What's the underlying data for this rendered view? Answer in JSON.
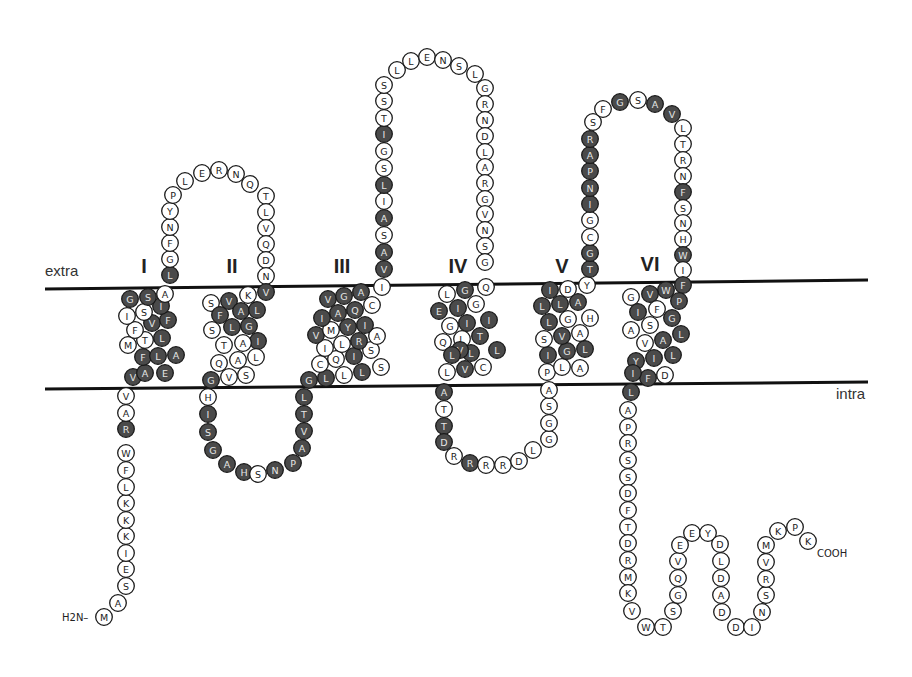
{
  "diagram": {
    "type": "membrane-topology",
    "regions": {
      "extra": "extra",
      "intra": "intra"
    },
    "termini": {
      "n": "H2N–",
      "c": "COOH"
    },
    "colors": {
      "dark": "#4a4a4a",
      "light": "#ffffff",
      "membrane": "#111111"
    },
    "membrane": {
      "top": {
        "x1": 45,
        "y1": 289,
        "x2": 868,
        "y2": 280
      },
      "bottom": {
        "x1": 45,
        "y1": 389,
        "x2": 868,
        "y2": 382
      }
    },
    "region_labels": [
      {
        "text": "extra",
        "x": 45,
        "y": 276
      },
      {
        "text": "intra",
        "x": 836,
        "y": 399
      }
    ],
    "tm_labels": [
      {
        "text": "I",
        "x": 144,
        "y": 273
      },
      {
        "text": "II",
        "x": 232,
        "y": 273
      },
      {
        "text": "III",
        "x": 342,
        "y": 273
      },
      {
        "text": "IV",
        "x": 458,
        "y": 273
      },
      {
        "text": "V",
        "x": 562,
        "y": 273
      },
      {
        "text": "VI",
        "x": 650,
        "y": 271
      }
    ],
    "residues": [
      [
        "M",
        104,
        617,
        0
      ],
      [
        "A",
        118,
        603,
        0
      ],
      [
        "S",
        126,
        586,
        0
      ],
      [
        "E",
        126,
        569,
        0
      ],
      [
        "I",
        126,
        553,
        0
      ],
      [
        "K",
        126,
        536,
        0
      ],
      [
        "K",
        126,
        520,
        0
      ],
      [
        "K",
        126,
        503,
        0
      ],
      [
        "L",
        126,
        487,
        0
      ],
      [
        "F",
        126,
        470,
        0
      ],
      [
        "W",
        126,
        453,
        0
      ],
      [
        "R",
        126,
        429,
        1
      ],
      [
        "A",
        126,
        413,
        0
      ],
      [
        "V",
        126,
        396,
        0
      ],
      [
        "V",
        133,
        377,
        1
      ],
      [
        "A",
        145,
        373,
        1
      ],
      [
        "E",
        165,
        373,
        1
      ],
      [
        "F",
        143,
        357,
        1
      ],
      [
        "L",
        158,
        356,
        1
      ],
      [
        "A",
        176,
        355,
        1
      ],
      [
        "M",
        128,
        345,
        0
      ],
      [
        "T",
        145,
        340,
        0
      ],
      [
        "L",
        162,
        338,
        1
      ],
      [
        "F",
        135,
        330,
        0
      ],
      [
        "V",
        152,
        323,
        1
      ],
      [
        "F",
        168,
        320,
        1
      ],
      [
        "I",
        127,
        316,
        0
      ],
      [
        "S",
        144,
        312,
        0
      ],
      [
        "I",
        161,
        306,
        1
      ],
      [
        "G",
        130,
        299,
        1
      ],
      [
        "S",
        148,
        297,
        1
      ],
      [
        "A",
        165,
        294,
        0
      ],
      [
        "L",
        170,
        275,
        1
      ],
      [
        "G",
        170,
        259,
        0
      ],
      [
        "F",
        170,
        243,
        0
      ],
      [
        "N",
        170,
        227,
        0
      ],
      [
        "Y",
        170,
        211,
        0
      ],
      [
        "P",
        173,
        195,
        0
      ],
      [
        "L",
        185,
        181,
        0
      ],
      [
        "E",
        202,
        173,
        0
      ],
      [
        "R",
        219,
        170,
        0
      ],
      [
        "N",
        236,
        174,
        0
      ],
      [
        "Q",
        250,
        184,
        0
      ],
      [
        "T",
        266,
        196,
        0
      ],
      [
        "L",
        266,
        212,
        0
      ],
      [
        "V",
        266,
        228,
        0
      ],
      [
        "Q",
        266,
        244,
        0
      ],
      [
        "D",
        266,
        260,
        0
      ],
      [
        "N",
        266,
        276,
        0
      ],
      [
        "V",
        266,
        292,
        1
      ],
      [
        "K",
        248,
        295,
        0
      ],
      [
        "V",
        229,
        301,
        1
      ],
      [
        "S",
        211,
        303,
        0
      ],
      [
        "A",
        241,
        311,
        1
      ],
      [
        "L",
        257,
        310,
        1
      ],
      [
        "F",
        220,
        315,
        1
      ],
      [
        "L",
        232,
        327,
        1
      ],
      [
        "G",
        249,
        326,
        1
      ],
      [
        "S",
        212,
        330,
        0
      ],
      [
        "I",
        258,
        341,
        1
      ],
      [
        "A",
        243,
        343,
        0
      ],
      [
        "T",
        224,
        345,
        0
      ],
      [
        "L",
        256,
        357,
        0
      ],
      [
        "A",
        238,
        360,
        0
      ],
      [
        "Q",
        219,
        363,
        0
      ],
      [
        "S",
        246,
        375,
        0
      ],
      [
        "V",
        229,
        377,
        0
      ],
      [
        "G",
        211,
        380,
        1
      ],
      [
        "H",
        208,
        397,
        0
      ],
      [
        "I",
        208,
        414,
        1
      ],
      [
        "S",
        208,
        432,
        1
      ],
      [
        "G",
        213,
        450,
        1
      ],
      [
        "A",
        227,
        464,
        1
      ],
      [
        "H",
        244,
        472,
        1
      ],
      [
        "S",
        258,
        474,
        0
      ],
      [
        "N",
        275,
        470,
        1
      ],
      [
        "P",
        293,
        463,
        1
      ],
      [
        "A",
        302,
        448,
        1
      ],
      [
        "V",
        304,
        431,
        1
      ],
      [
        "T",
        304,
        414,
        1
      ],
      [
        "L",
        304,
        397,
        1
      ],
      [
        "G",
        309,
        380,
        1
      ],
      [
        "L",
        326,
        378,
        1
      ],
      [
        "L",
        344,
        375,
        0
      ],
      [
        "L",
        362,
        372,
        1
      ],
      [
        "S",
        381,
        367,
        0
      ],
      [
        "C",
        320,
        364,
        0
      ],
      [
        "Q",
        336,
        359,
        0
      ],
      [
        "I",
        354,
        356,
        1
      ],
      [
        "S",
        371,
        350,
        0
      ],
      [
        "I",
        325,
        348,
        0
      ],
      [
        "L",
        342,
        344,
        0
      ],
      [
        "R",
        359,
        341,
        1
      ],
      [
        "A",
        377,
        336,
        0
      ],
      [
        "V",
        316,
        335,
        1
      ],
      [
        "M",
        331,
        330,
        0
      ],
      [
        "Y",
        348,
        327,
        1
      ],
      [
        "I",
        365,
        325,
        1
      ],
      [
        "I",
        322,
        318,
        1
      ],
      [
        "A",
        338,
        313,
        1
      ],
      [
        "Q",
        355,
        310,
        1
      ],
      [
        "C",
        372,
        305,
        0
      ],
      [
        "V",
        328,
        299,
        1
      ],
      [
        "G",
        344,
        296,
        1
      ],
      [
        "A",
        361,
        292,
        1
      ],
      [
        "I",
        382,
        287,
        0
      ],
      [
        "V",
        384,
        269,
        1
      ],
      [
        "A",
        384,
        252,
        1
      ],
      [
        "S",
        384,
        235,
        0
      ],
      [
        "A",
        384,
        218,
        1
      ],
      [
        "I",
        384,
        201,
        0
      ],
      [
        "L",
        384,
        185,
        1
      ],
      [
        "S",
        384,
        168,
        0
      ],
      [
        "G",
        384,
        151,
        0
      ],
      [
        "I",
        384,
        134,
        1
      ],
      [
        "T",
        384,
        118,
        0
      ],
      [
        "S",
        384,
        101,
        0
      ],
      [
        "S",
        384,
        85,
        0
      ],
      [
        "L",
        397,
        70,
        0
      ],
      [
        "L",
        411,
        61,
        0
      ],
      [
        "E",
        427,
        57,
        0
      ],
      [
        "N",
        443,
        60,
        0
      ],
      [
        "S",
        459,
        66,
        0
      ],
      [
        "L",
        475,
        74,
        0
      ],
      [
        "G",
        485,
        88,
        0
      ],
      [
        "R",
        485,
        104,
        0
      ],
      [
        "N",
        485,
        120,
        0
      ],
      [
        "D",
        485,
        136,
        0
      ],
      [
        "L",
        485,
        152,
        0
      ],
      [
        "A",
        485,
        167,
        0
      ],
      [
        "R",
        485,
        183,
        0
      ],
      [
        "G",
        485,
        199,
        0
      ],
      [
        "V",
        485,
        214,
        0
      ],
      [
        "N",
        485,
        230,
        0
      ],
      [
        "S",
        485,
        246,
        0
      ],
      [
        "G",
        485,
        262,
        0
      ],
      [
        "Q",
        486,
        287,
        0
      ],
      [
        "G",
        465,
        290,
        1
      ],
      [
        "L",
        447,
        294,
        0
      ],
      [
        "E",
        439,
        311,
        1
      ],
      [
        "I",
        458,
        308,
        1
      ],
      [
        "G",
        476,
        304,
        0
      ],
      [
        "G",
        450,
        326,
        0
      ],
      [
        "I",
        467,
        323,
        1
      ],
      [
        "I",
        489,
        320,
        1
      ],
      [
        "Q",
        443,
        342,
        0
      ],
      [
        "L",
        462,
        339,
        0
      ],
      [
        "T",
        480,
        336,
        1
      ],
      [
        "L",
        471,
        353,
        1
      ],
      [
        "V",
        460,
        350,
        1
      ],
      [
        "L",
        452,
        355,
        1
      ],
      [
        "L",
        497,
        350,
        1
      ],
      [
        "V",
        465,
        369,
        1
      ],
      [
        "C",
        483,
        367,
        0
      ],
      [
        "L",
        447,
        372,
        0
      ],
      [
        "A",
        444,
        392,
        1
      ],
      [
        "T",
        444,
        409,
        0
      ],
      [
        "T",
        444,
        426,
        1
      ],
      [
        "D",
        444,
        442,
        1
      ],
      [
        "R",
        454,
        456,
        0
      ],
      [
        "R",
        470,
        463,
        1
      ],
      [
        "R",
        486,
        465,
        0
      ],
      [
        "R",
        503,
        465,
        0
      ],
      [
        "D",
        519,
        461,
        0
      ],
      [
        "L",
        533,
        450,
        0
      ],
      [
        "G",
        549,
        439,
        0
      ],
      [
        "G",
        549,
        423,
        0
      ],
      [
        "S",
        549,
        406,
        0
      ],
      [
        "A",
        549,
        390,
        0
      ],
      [
        "P",
        547,
        372,
        0
      ],
      [
        "L",
        562,
        367,
        0
      ],
      [
        "A",
        580,
        368,
        0
      ],
      [
        "I",
        548,
        355,
        1
      ],
      [
        "G",
        567,
        351,
        1
      ],
      [
        "L",
        585,
        349,
        1
      ],
      [
        "S",
        544,
        339,
        0
      ],
      [
        "V",
        562,
        336,
        1
      ],
      [
        "A",
        580,
        333,
        0
      ],
      [
        "L",
        549,
        322,
        1
      ],
      [
        "G",
        568,
        319,
        0
      ],
      [
        "H",
        590,
        318,
        0
      ],
      [
        "L",
        542,
        306,
        1
      ],
      [
        "L",
        560,
        304,
        1
      ],
      [
        "A",
        578,
        302,
        1
      ],
      [
        "I",
        550,
        290,
        1
      ],
      [
        "D",
        568,
        289,
        0
      ],
      [
        "Y",
        587,
        285,
        0
      ],
      [
        "T",
        590,
        269,
        1
      ],
      [
        "G",
        590,
        253,
        1
      ],
      [
        "C",
        590,
        237,
        0
      ],
      [
        "G",
        590,
        220,
        0
      ],
      [
        "I",
        590,
        204,
        1
      ],
      [
        "N",
        590,
        188,
        1
      ],
      [
        "P",
        590,
        171,
        1
      ],
      [
        "A",
        590,
        155,
        1
      ],
      [
        "R",
        590,
        139,
        1
      ],
      [
        "S",
        593,
        122,
        0
      ],
      [
        "F",
        603,
        109,
        0
      ],
      [
        "G",
        620,
        102,
        1
      ],
      [
        "S",
        638,
        100,
        0
      ],
      [
        "A",
        655,
        104,
        1
      ],
      [
        "V",
        672,
        114,
        1
      ],
      [
        "L",
        683,
        128,
        0
      ],
      [
        "T",
        683,
        144,
        0
      ],
      [
        "R",
        683,
        160,
        0
      ],
      [
        "N",
        683,
        176,
        0
      ],
      [
        "F",
        683,
        192,
        1
      ],
      [
        "S",
        683,
        208,
        0
      ],
      [
        "N",
        683,
        223,
        0
      ],
      [
        "H",
        683,
        239,
        0
      ],
      [
        "W",
        683,
        255,
        1
      ],
      [
        "I",
        683,
        270,
        0
      ],
      [
        "F",
        683,
        285,
        1
      ],
      [
        "W",
        666,
        290,
        1
      ],
      [
        "V",
        650,
        294,
        1
      ],
      [
        "G",
        631,
        297,
        0
      ],
      [
        "P",
        679,
        301,
        1
      ],
      [
        "F",
        657,
        309,
        0
      ],
      [
        "I",
        638,
        312,
        1
      ],
      [
        "G",
        672,
        318,
        1
      ],
      [
        "S",
        650,
        325,
        0
      ],
      [
        "A",
        631,
        330,
        0
      ],
      [
        "L",
        681,
        334,
        1
      ],
      [
        "A",
        663,
        340,
        1
      ],
      [
        "V",
        645,
        343,
        0
      ],
      [
        "L",
        673,
        355,
        1
      ],
      [
        "I",
        654,
        358,
        1
      ],
      [
        "Y",
        636,
        361,
        1
      ],
      [
        "D",
        665,
        375,
        0
      ],
      [
        "F",
        648,
        378,
        1
      ],
      [
        "I",
        633,
        373,
        1
      ],
      [
        "L",
        631,
        392,
        1
      ],
      [
        "A",
        628,
        410,
        0
      ],
      [
        "P",
        628,
        427,
        0
      ],
      [
        "R",
        628,
        443,
        0
      ],
      [
        "S",
        628,
        460,
        0
      ],
      [
        "S",
        628,
        477,
        0
      ],
      [
        "D",
        628,
        493,
        0
      ],
      [
        "F",
        628,
        510,
        0
      ],
      [
        "T",
        628,
        527,
        0
      ],
      [
        "D",
        628,
        543,
        0
      ],
      [
        "R",
        628,
        560,
        0
      ],
      [
        "M",
        628,
        577,
        0
      ],
      [
        "K",
        628,
        593,
        0
      ],
      [
        "V",
        632,
        611,
        0
      ],
      [
        "W",
        646,
        627,
        0
      ],
      [
        "T",
        663,
        627,
        0
      ],
      [
        "S",
        673,
        611,
        0
      ],
      [
        "G",
        678,
        595,
        0
      ],
      [
        "Q",
        678,
        578,
        0
      ],
      [
        "V",
        678,
        561,
        0
      ],
      [
        "E",
        680,
        545,
        0
      ],
      [
        "E",
        692,
        533,
        0
      ],
      [
        "Y",
        708,
        533,
        0
      ],
      [
        "D",
        720,
        544,
        0
      ],
      [
        "L",
        721,
        561,
        0
      ],
      [
        "D",
        721,
        578,
        0
      ],
      [
        "A",
        721,
        595,
        0
      ],
      [
        "D",
        722,
        612,
        0
      ],
      [
        "D",
        736,
        627,
        0
      ],
      [
        "I",
        752,
        627,
        0
      ],
      [
        "N",
        762,
        612,
        0
      ],
      [
        "S",
        766,
        595,
        0
      ],
      [
        "R",
        766,
        579,
        0
      ],
      [
        "V",
        766,
        562,
        0
      ],
      [
        "M",
        766,
        545,
        0
      ],
      [
        "K",
        778,
        531,
        0
      ],
      [
        "P",
        795,
        527,
        0
      ],
      [
        "K",
        808,
        541,
        0
      ]
    ]
  }
}
